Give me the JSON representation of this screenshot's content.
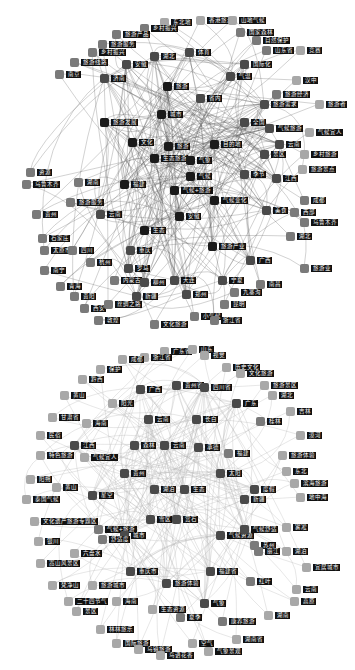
{
  "colors": {
    "core": "#1a1a1a",
    "mid": "#4a4a4a",
    "outer": "#7a7a7a",
    "faint": "#a8a8a8",
    "edge": "#555555",
    "edge_light": "#b5b5b5",
    "label_bg": "#111111",
    "label_fg": "#ffffff"
  },
  "top_graph": {
    "nodes": [
      {
        "label": "东北地",
        "x": 160,
        "y": 18,
        "tone": "faint"
      },
      {
        "label": "香港旅游",
        "x": 196,
        "y": 16,
        "tone": "faint"
      },
      {
        "label": "山地气候",
        "x": 228,
        "y": 16,
        "tone": "faint"
      },
      {
        "label": "乡村振兴",
        "x": 140,
        "y": 24,
        "tone": "outer"
      },
      {
        "label": "旅游产品",
        "x": 112,
        "y": 30,
        "tone": "outer"
      },
      {
        "label": "国家森林",
        "x": 236,
        "y": 28,
        "tone": "outer"
      },
      {
        "label": "自然保护",
        "x": 252,
        "y": 36,
        "tone": "outer"
      },
      {
        "label": "旅游服务",
        "x": 98,
        "y": 40,
        "tone": "outer"
      },
      {
        "label": "山东省",
        "x": 262,
        "y": 46,
        "tone": "outer"
      },
      {
        "label": "竞赛",
        "x": 296,
        "y": 46,
        "tone": "faint"
      },
      {
        "label": "乡村振兴",
        "x": 88,
        "y": 48,
        "tone": "outer"
      },
      {
        "label": "湖北",
        "x": 150,
        "y": 52,
        "tone": "mid"
      },
      {
        "label": "体育",
        "x": 185,
        "y": 48,
        "tone": "mid"
      },
      {
        "label": "国际化",
        "x": 240,
        "y": 60,
        "tone": "mid"
      },
      {
        "label": "气温",
        "x": 226,
        "y": 72,
        "tone": "mid"
      },
      {
        "label": "汉中",
        "x": 292,
        "y": 76,
        "tone": "faint"
      },
      {
        "label": "旅游线路",
        "x": 70,
        "y": 58,
        "tone": "outer"
      },
      {
        "label": "安徽",
        "x": 122,
        "y": 60,
        "tone": "mid"
      },
      {
        "label": "南京",
        "x": 55,
        "y": 70,
        "tone": "outer"
      },
      {
        "label": "济南",
        "x": 100,
        "y": 74,
        "tone": "mid"
      },
      {
        "label": "旅游",
        "x": 163,
        "y": 82,
        "tone": "core"
      },
      {
        "label": "省内",
        "x": 196,
        "y": 94,
        "tone": "mid"
      },
      {
        "label": "旅游经济",
        "x": 272,
        "y": 90,
        "tone": "outer"
      },
      {
        "label": "旅游者",
        "x": 315,
        "y": 100,
        "tone": "faint"
      },
      {
        "label": "城市",
        "x": 157,
        "y": 110,
        "tone": "core"
      },
      {
        "label": "旅游需求",
        "x": 260,
        "y": 100,
        "tone": "mid"
      },
      {
        "label": "旅游发展",
        "x": 100,
        "y": 118,
        "tone": "core"
      },
      {
        "label": "全国",
        "x": 240,
        "y": 118,
        "tone": "mid"
      },
      {
        "label": "气候旅游",
        "x": 265,
        "y": 124,
        "tone": "mid"
      },
      {
        "label": "气候宜人",
        "x": 305,
        "y": 128,
        "tone": "faint"
      },
      {
        "label": "文化",
        "x": 128,
        "y": 138,
        "tone": "core"
      },
      {
        "label": "旅游",
        "x": 164,
        "y": 142,
        "tone": "core"
      },
      {
        "label": "目的地",
        "x": 210,
        "y": 140,
        "tone": "core"
      },
      {
        "label": "生态旅游",
        "x": 150,
        "y": 154,
        "tone": "core"
      },
      {
        "label": "气象",
        "x": 186,
        "y": 156,
        "tone": "core"
      },
      {
        "label": "景区",
        "x": 260,
        "y": 150,
        "tone": "mid"
      },
      {
        "label": "云南",
        "x": 275,
        "y": 140,
        "tone": "mid"
      },
      {
        "label": "季节",
        "x": 240,
        "y": 170,
        "tone": "mid"
      },
      {
        "label": "乡村旅游",
        "x": 300,
        "y": 150,
        "tone": "faint"
      },
      {
        "label": "旅游景点",
        "x": 298,
        "y": 165,
        "tone": "faint"
      },
      {
        "label": "气候",
        "x": 186,
        "y": 172,
        "tone": "core"
      },
      {
        "label": "气候+旅游",
        "x": 170,
        "y": 186,
        "tone": "core"
      },
      {
        "label": "气候变化",
        "x": 210,
        "y": 196,
        "tone": "core"
      },
      {
        "label": "江西",
        "x": 272,
        "y": 174,
        "tone": "mid"
      },
      {
        "label": "成都",
        "x": 300,
        "y": 196,
        "tone": "outer"
      },
      {
        "label": "福建",
        "x": 120,
        "y": 180,
        "tone": "core"
      },
      {
        "label": "湖南",
        "x": 74,
        "y": 178,
        "tone": "outer"
      },
      {
        "label": "旅游服务",
        "x": 66,
        "y": 198,
        "tone": "outer"
      },
      {
        "label": "云南",
        "x": 96,
        "y": 210,
        "tone": "mid"
      },
      {
        "label": "安徽",
        "x": 175,
        "y": 212,
        "tone": "core"
      },
      {
        "label": "美食",
        "x": 262,
        "y": 206,
        "tone": "mid"
      },
      {
        "label": "西部",
        "x": 290,
        "y": 208,
        "tone": "outer"
      },
      {
        "label": "乌鲁木齐",
        "x": 300,
        "y": 218,
        "tone": "outer"
      },
      {
        "label": "湖北",
        "x": 286,
        "y": 232,
        "tone": "outer"
      },
      {
        "label": "旅游产业",
        "x": 208,
        "y": 242,
        "tone": "core"
      },
      {
        "label": "生态",
        "x": 140,
        "y": 226,
        "tone": "core"
      },
      {
        "label": "广西",
        "x": 246,
        "y": 256,
        "tone": "mid"
      },
      {
        "label": "旅游业",
        "x": 300,
        "y": 264,
        "tone": "outer"
      },
      {
        "label": "资源",
        "x": 26,
        "y": 168,
        "tone": "outer"
      },
      {
        "label": "乌鲁木齐",
        "x": 22,
        "y": 180,
        "tone": "outer"
      },
      {
        "label": "贵州",
        "x": 32,
        "y": 210,
        "tone": "outer"
      },
      {
        "label": "石家庄",
        "x": 38,
        "y": 234,
        "tone": "outer"
      },
      {
        "label": "太原市",
        "x": 40,
        "y": 246,
        "tone": "outer"
      },
      {
        "label": "四川",
        "x": 68,
        "y": 246,
        "tone": "outer"
      },
      {
        "label": "重庆",
        "x": 126,
        "y": 246,
        "tone": "mid"
      },
      {
        "label": "罗马",
        "x": 124,
        "y": 264,
        "tone": "mid"
      },
      {
        "label": "南宁",
        "x": 40,
        "y": 266,
        "tone": "outer"
      },
      {
        "label": "杭州",
        "x": 86,
        "y": 258,
        "tone": "outer"
      },
      {
        "label": "青海",
        "x": 56,
        "y": 282,
        "tone": "outer"
      },
      {
        "label": "贵阳",
        "x": 70,
        "y": 292,
        "tone": "outer"
      },
      {
        "label": "内蒙古",
        "x": 110,
        "y": 276,
        "tone": "outer"
      },
      {
        "label": "柳州",
        "x": 140,
        "y": 278,
        "tone": "mid"
      },
      {
        "label": "大连",
        "x": 170,
        "y": 276,
        "tone": "mid"
      },
      {
        "label": "宁夏",
        "x": 218,
        "y": 276,
        "tone": "mid"
      },
      {
        "label": "九寨沟",
        "x": 230,
        "y": 288,
        "tone": "outer"
      },
      {
        "label": "南昌",
        "x": 256,
        "y": 280,
        "tone": "outer"
      },
      {
        "label": "西安",
        "x": 80,
        "y": 304,
        "tone": "outer"
      },
      {
        "label": "敦煌",
        "x": 94,
        "y": 316,
        "tone": "outer"
      },
      {
        "label": "新疆",
        "x": 132,
        "y": 292,
        "tone": "mid"
      },
      {
        "label": "郑州",
        "x": 182,
        "y": 290,
        "tone": "mid"
      },
      {
        "label": "昆明",
        "x": 220,
        "y": 300,
        "tone": "outer"
      },
      {
        "label": "丝绸之路",
        "x": 104,
        "y": 300,
        "tone": "outer"
      },
      {
        "label": "小气候",
        "x": 190,
        "y": 312,
        "tone": "outer"
      },
      {
        "label": "浙江省",
        "x": 210,
        "y": 316,
        "tone": "outer"
      },
      {
        "label": "文化旅游",
        "x": 150,
        "y": 320,
        "tone": "outer"
      }
    ],
    "hubs": [
      "旅游",
      "气象",
      "气候",
      "气候+旅游",
      "生态旅游",
      "目的地",
      "城市",
      "文化"
    ]
  },
  "bottom_graph": {
    "nodes": [
      {
        "label": "广东省",
        "x": 160,
        "y": 12,
        "tone": "faint"
      },
      {
        "label": "浙江省",
        "x": 140,
        "y": 18,
        "tone": "faint"
      },
      {
        "label": "山东",
        "x": 188,
        "y": 10,
        "tone": "faint"
      },
      {
        "label": "成都",
        "x": 118,
        "y": 20,
        "tone": "faint"
      },
      {
        "label": "视觉",
        "x": 200,
        "y": 16,
        "tone": "faint"
      },
      {
        "label": "历史文化",
        "x": 222,
        "y": 28,
        "tone": "faint"
      },
      {
        "label": "文化旅游",
        "x": 236,
        "y": 34,
        "tone": "faint"
      },
      {
        "label": "保护",
        "x": 96,
        "y": 30,
        "tone": "faint"
      },
      {
        "label": "黔西",
        "x": 78,
        "y": 40,
        "tone": "faint"
      },
      {
        "label": "广西",
        "x": 136,
        "y": 50,
        "tone": "mid"
      },
      {
        "label": "贵州省",
        "x": 172,
        "y": 46,
        "tone": "mid"
      },
      {
        "label": "四川省",
        "x": 200,
        "y": 48,
        "tone": "mid"
      },
      {
        "label": "旅游景区",
        "x": 260,
        "y": 46,
        "tone": "faint"
      },
      {
        "label": "湖北",
        "x": 268,
        "y": 56,
        "tone": "faint"
      },
      {
        "label": "黄山",
        "x": 60,
        "y": 56,
        "tone": "faint"
      },
      {
        "label": "阳光",
        "x": 108,
        "y": 64,
        "tone": "faint"
      },
      {
        "label": "广东",
        "x": 232,
        "y": 64,
        "tone": "mid"
      },
      {
        "label": "甘肃省",
        "x": 48,
        "y": 78,
        "tone": "faint"
      },
      {
        "label": "海南",
        "x": 82,
        "y": 84,
        "tone": "faint"
      },
      {
        "label": "云南",
        "x": 144,
        "y": 80,
        "tone": "mid"
      },
      {
        "label": "长白",
        "x": 192,
        "y": 80,
        "tone": "mid"
      },
      {
        "label": "桂林",
        "x": 256,
        "y": 82,
        "tone": "outer"
      },
      {
        "label": "吉林",
        "x": 286,
        "y": 72,
        "tone": "faint"
      },
      {
        "label": "民宿",
        "x": 36,
        "y": 96,
        "tone": "faint"
      },
      {
        "label": "江西",
        "x": 70,
        "y": 106,
        "tone": "mid"
      },
      {
        "label": "森林",
        "x": 130,
        "y": 106,
        "tone": "mid"
      },
      {
        "label": "云南",
        "x": 160,
        "y": 106,
        "tone": "mid"
      },
      {
        "label": "承德",
        "x": 194,
        "y": 108,
        "tone": "mid"
      },
      {
        "label": "漠河",
        "x": 296,
        "y": 96,
        "tone": "faint"
      },
      {
        "label": "特色旅游",
        "x": 36,
        "y": 116,
        "tone": "faint"
      },
      {
        "label": "气候宜人",
        "x": 80,
        "y": 118,
        "tone": "faint"
      },
      {
        "label": "福建",
        "x": 224,
        "y": 114,
        "tone": "outer"
      },
      {
        "label": "旅游体验",
        "x": 278,
        "y": 116,
        "tone": "faint"
      },
      {
        "label": "贵州",
        "x": 120,
        "y": 134,
        "tone": "mid"
      },
      {
        "label": "太阳",
        "x": 216,
        "y": 134,
        "tone": "mid"
      },
      {
        "label": "东北",
        "x": 282,
        "y": 132,
        "tone": "faint"
      },
      {
        "label": "阳朔",
        "x": 26,
        "y": 140,
        "tone": "faint"
      },
      {
        "label": "黄山",
        "x": 52,
        "y": 148,
        "tone": "faint"
      },
      {
        "label": "星空",
        "x": 88,
        "y": 156,
        "tone": "mid"
      },
      {
        "label": "湖泊",
        "x": 150,
        "y": 150,
        "tone": "mid"
      },
      {
        "label": "生态",
        "x": 180,
        "y": 150,
        "tone": "mid"
      },
      {
        "label": "度假",
        "x": 250,
        "y": 150,
        "tone": "mid"
      },
      {
        "label": "滨海旅游",
        "x": 290,
        "y": 144,
        "tone": "faint"
      },
      {
        "label": "泰国气候",
        "x": 22,
        "y": 160,
        "tone": "faint"
      },
      {
        "label": "新疆",
        "x": 240,
        "y": 160,
        "tone": "mid"
      },
      {
        "label": "地中海",
        "x": 296,
        "y": 158,
        "tone": "faint"
      },
      {
        "label": "文化遗产旅游专题区",
        "x": 30,
        "y": 182,
        "tone": "faint"
      },
      {
        "label": "雪区",
        "x": 146,
        "y": 180,
        "tone": "mid"
      },
      {
        "label": "赏石",
        "x": 172,
        "y": 180,
        "tone": "mid"
      },
      {
        "label": "气候+旅游",
        "x": 94,
        "y": 190,
        "tone": "outer"
      },
      {
        "label": "城市",
        "x": 120,
        "y": 196,
        "tone": "mid"
      },
      {
        "label": "气候资源",
        "x": 216,
        "y": 196,
        "tone": "mid"
      },
      {
        "label": "舒适度",
        "x": 98,
        "y": 200,
        "tone": "outer"
      },
      {
        "label": "气候舒适",
        "x": 240,
        "y": 190,
        "tone": "mid"
      },
      {
        "label": "雾凇",
        "x": 282,
        "y": 188,
        "tone": "faint"
      },
      {
        "label": "苏州",
        "x": 250,
        "y": 206,
        "tone": "outer"
      },
      {
        "label": "银川",
        "x": 34,
        "y": 202,
        "tone": "faint"
      },
      {
        "label": "丽江",
        "x": 254,
        "y": 212,
        "tone": "outer"
      },
      {
        "label": "湖泊",
        "x": 282,
        "y": 212,
        "tone": "faint"
      },
      {
        "label": "六盘水",
        "x": 70,
        "y": 214,
        "tone": "faint"
      },
      {
        "label": "嵩山风景区",
        "x": 36,
        "y": 224,
        "tone": "faint"
      },
      {
        "label": "重庆市",
        "x": 126,
        "y": 232,
        "tone": "mid"
      },
      {
        "label": "梵净山",
        "x": 48,
        "y": 246,
        "tone": "faint"
      },
      {
        "label": "旅游城市",
        "x": 88,
        "y": 246,
        "tone": "faint"
      },
      {
        "label": "旅游体验",
        "x": 162,
        "y": 244,
        "tone": "mid"
      },
      {
        "label": "福建省",
        "x": 206,
        "y": 232,
        "tone": "mid"
      },
      {
        "label": "红叶",
        "x": 246,
        "y": 242,
        "tone": "outer"
      },
      {
        "label": "宜居城市",
        "x": 302,
        "y": 228,
        "tone": "faint"
      },
      {
        "label": "云南",
        "x": 292,
        "y": 250,
        "tone": "faint"
      },
      {
        "label": "二十四节气",
        "x": 64,
        "y": 262,
        "tone": "faint"
      },
      {
        "label": "海南",
        "x": 112,
        "y": 262,
        "tone": "faint"
      },
      {
        "label": "生态资源",
        "x": 148,
        "y": 270,
        "tone": "faint"
      },
      {
        "label": "气象",
        "x": 200,
        "y": 264,
        "tone": "mid"
      },
      {
        "label": "高原",
        "x": 290,
        "y": 262,
        "tone": "faint"
      },
      {
        "label": "景区",
        "x": 72,
        "y": 272,
        "tone": "faint"
      },
      {
        "label": "夏季",
        "x": 176,
        "y": 278,
        "tone": "outer"
      },
      {
        "label": "康养旅游",
        "x": 218,
        "y": 282,
        "tone": "outer"
      },
      {
        "label": "湖南",
        "x": 264,
        "y": 276,
        "tone": "faint"
      },
      {
        "label": "林林旅乐",
        "x": 96,
        "y": 290,
        "tone": "faint"
      },
      {
        "label": "国际旅游",
        "x": 112,
        "y": 304,
        "tone": "faint"
      },
      {
        "label": "乌镇旅游",
        "x": 134,
        "y": 310,
        "tone": "faint"
      },
      {
        "label": "鸟语花香",
        "x": 156,
        "y": 316,
        "tone": "faint"
      },
      {
        "label": "空气",
        "x": 188,
        "y": 304,
        "tone": "faint"
      },
      {
        "label": "气象景观",
        "x": 204,
        "y": 312,
        "tone": "faint"
      },
      {
        "label": "湖南省",
        "x": 232,
        "y": 300,
        "tone": "faint"
      }
    ]
  }
}
